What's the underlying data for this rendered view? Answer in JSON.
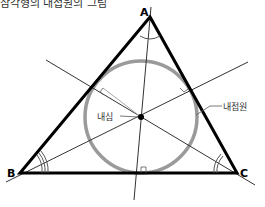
{
  "title": "삼각형의 내접원의 그림",
  "vertices": {
    "A": {
      "label": "A"
    },
    "B": {
      "label": "B"
    },
    "C": {
      "label": "C"
    }
  },
  "annotations": {
    "incenter": "내심",
    "incircle": "내접원"
  },
  "colors": {
    "triangle": "#000000",
    "circle": "#999999",
    "bisectors": "#333333"
  }
}
